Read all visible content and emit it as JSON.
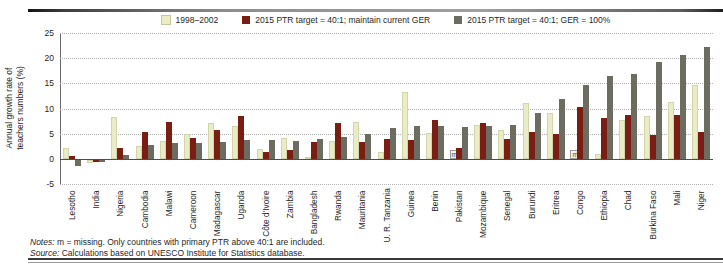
{
  "legend": [
    {
      "label": "1998–2002",
      "color": "#eaecc6"
    },
    {
      "label": "2015 PTR target = 40:1; maintain current GER",
      "color": "#7a1d13"
    },
    {
      "label": "2015 PTR target = 40:1; GER = 100%",
      "color": "#6c6d60"
    }
  ],
  "chart_data": {
    "type": "bar",
    "title": "",
    "ylabel": "Annual growth rate of teachers numbers (%)",
    "ylim": [
      -5,
      25
    ],
    "yticks": [
      25,
      20,
      15,
      10,
      5,
      0,
      -5
    ],
    "grid": "horizontal-dotted",
    "legend_position": "top-center",
    "missing_label": "m",
    "categories": [
      "Lesotho",
      "India",
      "Nigeria",
      "Cambodia",
      "Malawi",
      "Cameroon",
      "Madagascar",
      "Uganda",
      "Côte d'Ivoire",
      "Zambia",
      "Bangladesh",
      "Rwanda",
      "Mauritania",
      "U. R. Tanzania",
      "Guinea",
      "Benin",
      "Pakistan",
      "Mozambique",
      "Senegal",
      "Burundi",
      "Eritrea",
      "Congo",
      "Ethiopia",
      "Chad",
      "Burkina Faso",
      "Mali",
      "Niger"
    ],
    "series": [
      {
        "name": "1998–2002",
        "color": "#eaecc6",
        "values": [
          2.2,
          -0.6,
          8.3,
          2.6,
          3.6,
          5.0,
          7.2,
          6.5,
          2.0,
          4.1,
          0.3,
          3.5,
          7.4,
          1.4,
          13.3,
          5.2,
          null,
          6.7,
          5.8,
          11.0,
          9.1,
          null,
          1.0,
          7.8,
          8.6,
          11.2,
          14.7
        ]
      },
      {
        "name": "2015 PTR target = 40:1; maintain current GER",
        "color": "#7a1d13",
        "values": [
          0.5,
          -0.4,
          2.2,
          5.4,
          7.4,
          4.2,
          5.7,
          8.6,
          1.3,
          1.8,
          3.4,
          7.1,
          3.4,
          3.9,
          3.7,
          7.8,
          2.1,
          7.1,
          3.9,
          5.3,
          4.9,
          10.2,
          8.2,
          8.7,
          4.8,
          8.8,
          5.3
        ]
      },
      {
        "name": "2015 PTR target = 40:1; GER = 100%",
        "color": "#6c6d60",
        "values": [
          -1.2,
          -0.4,
          0.8,
          2.8,
          3.2,
          3.2,
          3.4,
          3.7,
          3.8,
          3.6,
          3.9,
          4.4,
          5.0,
          6.1,
          6.6,
          6.5,
          6.4,
          6.5,
          6.8,
          9.2,
          11.9,
          14.7,
          16.5,
          16.9,
          19.3,
          20.6,
          22.2
        ]
      }
    ]
  },
  "notes": {
    "line1_label": "Notes:",
    "line1_text": "m = missing. Only countries with primary PTR above 40:1 are included.",
    "line2_label": "Source:",
    "line2_text": "Calculations based on UNESCO Institute for Statistics database."
  }
}
